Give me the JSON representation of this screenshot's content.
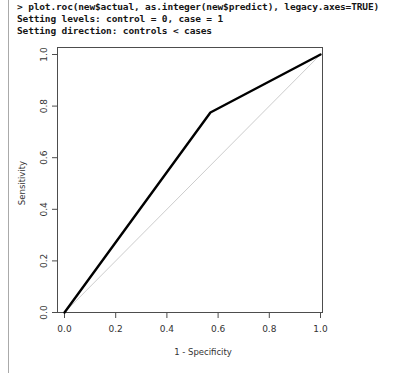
{
  "console": {
    "lines": [
      "> plot.roc(new$actual, as.integer(new$predict), legacy.axes=TRUE)",
      "Setting levels: control = 0, case = 1",
      "Setting direction: controls < cases"
    ]
  },
  "chart_data": {
    "type": "line",
    "title": "",
    "xlabel": "1 - Specificity",
    "ylabel": "Sensitivity",
    "xlim": [
      0.0,
      1.0
    ],
    "ylim": [
      0.0,
      1.0
    ],
    "grid": false,
    "legend": "none",
    "xticks": [
      "0.0",
      "0.2",
      "0.4",
      "0.6",
      "0.8",
      "1.0"
    ],
    "xtickvalues": [
      0.0,
      0.2,
      0.4,
      0.6,
      0.8,
      1.0
    ],
    "yticks": [
      "0.0",
      "0.2",
      "0.4",
      "0.6",
      "0.8",
      "1.0"
    ],
    "ytickvalues": [
      0.0,
      0.2,
      0.4,
      0.6,
      0.8,
      1.0
    ],
    "series": [
      {
        "name": "ROC curve",
        "color": "#000000",
        "width": 2.4,
        "x": [
          0.0,
          0.57,
          1.0
        ],
        "y": [
          0.0,
          0.775,
          1.0
        ]
      },
      {
        "name": "chance diagonal",
        "color": "#bfbfbf",
        "width": 0.8,
        "x": [
          0.0,
          1.0
        ],
        "y": [
          0.0,
          1.0
        ]
      }
    ]
  },
  "axes": {
    "frame_color": "#4d4d4d",
    "tick_color": "#4d4d4d"
  }
}
